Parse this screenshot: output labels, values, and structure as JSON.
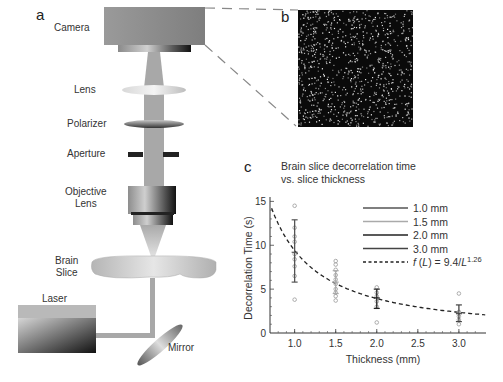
{
  "panels": {
    "a": {
      "letter": "a"
    },
    "b": {
      "letter": "b"
    },
    "c": {
      "letter": "c",
      "title_line1": "Brain slice decorrelation time",
      "title_line2": "vs. slice thickness"
    }
  },
  "setup_labels": {
    "camera": "Camera",
    "lens": "Lens",
    "polarizer": "Polarizer",
    "aperture": "Aperture",
    "objective_line1": "Objective",
    "objective_line2": "Lens",
    "brain_line1": "Brain",
    "brain_line2": "Slice",
    "laser": "Laser",
    "mirror": "Mirror"
  },
  "colors": {
    "beam": "#a8a8a8",
    "camera_body": "#8f8f8f",
    "speckle_bg": "#0a0a0a",
    "dashed_connector": "#888888",
    "fit_line": "#222222"
  },
  "chart_data": {
    "type": "scatter",
    "title": "Brain slice decorrelation time vs. slice thickness",
    "xlabel": "Thickness (mm)",
    "ylabel": "Decorrelation Time (s)",
    "xlim": [
      0.7,
      3.33
    ],
    "ylim": [
      0,
      15.5
    ],
    "xticks": [
      "1.0",
      "1.5",
      "2.0",
      "2.5",
      "3.0"
    ],
    "yticks": [
      "0",
      "5",
      "10",
      "15"
    ],
    "grid": false,
    "legend_position": "upper right",
    "legend": [
      {
        "label": "1.0 mm",
        "color": "#555555",
        "style": "solid"
      },
      {
        "label": "1.5 mm",
        "color": "#aaaaaa",
        "style": "solid"
      },
      {
        "label": "2.0 mm",
        "color": "#222222",
        "style": "solid"
      },
      {
        "label": "3.0 mm",
        "color": "#444444",
        "style": "solid"
      },
      {
        "label": "f (L) = 9.4/L",
        "superscript": "1.26",
        "color": "#222222",
        "style": "dashed"
      }
    ],
    "series": [
      {
        "name": "1.0 mm",
        "thickness": 1.0,
        "mean": 9.2,
        "err_low": 5.8,
        "err_high": 12.9,
        "color": "#555555",
        "points": [
          14.5,
          12.0,
          11.0,
          10.4,
          9.0,
          8.4,
          7.6,
          6.5,
          3.8
        ]
      },
      {
        "name": "1.5 mm",
        "thickness": 1.5,
        "mean": 5.8,
        "err_low": 4.5,
        "err_high": 7.1,
        "color": "#aaaaaa",
        "points": [
          8.2,
          7.8,
          7.2,
          6.6,
          6.1,
          5.6,
          5.0,
          4.6,
          4.2,
          3.7
        ]
      },
      {
        "name": "2.0 mm",
        "thickness": 2.0,
        "mean": 4.0,
        "err_low": 2.8,
        "err_high": 5.0,
        "color": "#222222",
        "points": [
          5.2,
          4.6,
          4.2,
          3.6,
          3.0,
          1.2
        ]
      },
      {
        "name": "3.0 mm",
        "thickness": 3.0,
        "mean": 2.2,
        "err_low": 1.3,
        "err_high": 3.2,
        "color": "#444444",
        "points": [
          4.5,
          2.4,
          1.9,
          1.5,
          1.0
        ]
      }
    ],
    "fit": {
      "name": "f (L) = 9.4/L^1.26",
      "a": 9.4,
      "b": 1.26,
      "style": "dashed"
    }
  }
}
